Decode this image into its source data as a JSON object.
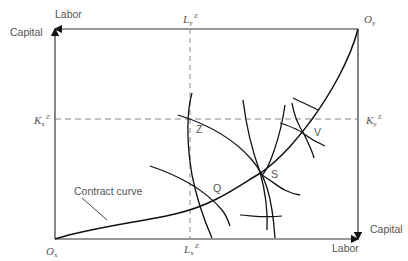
{
  "diagram": {
    "type": "edgeworth-box",
    "origins": {
      "bottom_left": {
        "label": "O",
        "subscript": "x"
      },
      "top_right": {
        "label": "O",
        "subscript": "y"
      }
    },
    "axes": {
      "bottom_left_up": "Capital",
      "bottom_left_right": "Labor",
      "top_right_down": "Capital",
      "top_right_left": "Labor"
    },
    "axis_labels": {
      "top_left_labor": "Labor",
      "top_left_capital": "Capital",
      "bottom_right_capital": "Capital",
      "bottom_right_labor": "Labor"
    },
    "reference_lines": {
      "top": {
        "label": "L",
        "subscript": "y",
        "superscript": "Z"
      },
      "bottom": {
        "label": "L",
        "subscript": "x",
        "superscript": "Z"
      },
      "left": {
        "label": "K",
        "subscript": "x",
        "superscript": "Z"
      },
      "right": {
        "label": "K",
        "subscript": "y",
        "superscript": "Z"
      }
    },
    "points": [
      {
        "name": "Z"
      },
      {
        "name": "Q"
      },
      {
        "name": "S"
      },
      {
        "name": "V"
      }
    ],
    "curve_label": "Contract curve",
    "colors": {
      "line": "#1a1a1a",
      "text": "#555555",
      "dashed": "#888888"
    }
  }
}
